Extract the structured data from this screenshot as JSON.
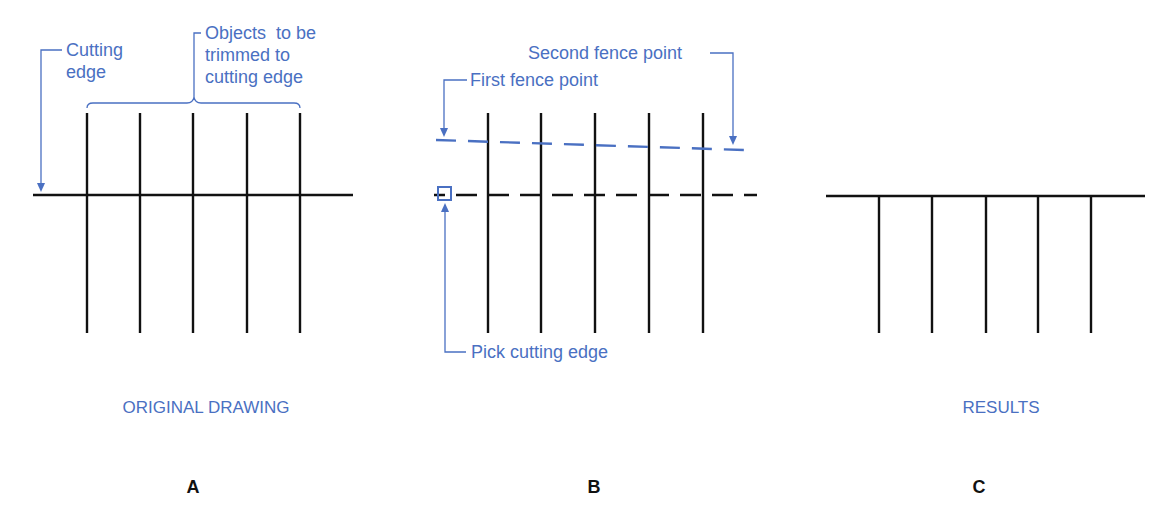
{
  "colors": {
    "annotation": "#4a70c2",
    "lines": "#111111",
    "background": "#ffffff"
  },
  "panels": [
    {
      "letter": "A",
      "caption": "ORIGINAL DRAWING",
      "annotations": {
        "cutting_edge": [
          "Cutting",
          "edge"
        ],
        "objects": [
          "Objects  to be",
          "trimmed to",
          "cutting edge"
        ]
      }
    },
    {
      "letter": "B",
      "caption": "",
      "annotations": {
        "second_fence": "Second fence point",
        "first_fence": "First fence point",
        "pick_edge": "Pick cutting edge"
      }
    },
    {
      "letter": "C",
      "caption": "RESULTS",
      "annotations": {}
    }
  ]
}
